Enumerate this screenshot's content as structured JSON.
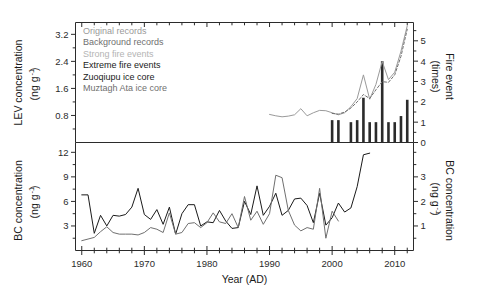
{
  "chart_data": {
    "type": "line",
    "title": "",
    "xlabel": "Year (AD)",
    "xlim": [
      1959,
      2013
    ],
    "xticks": [
      1960,
      1970,
      1980,
      1990,
      2000,
      2010
    ],
    "xticklabels": [
      "1960",
      "1970",
      "1980",
      "1990",
      "2000",
      "2010"
    ],
    "x_minor_step": 2,
    "grid": false,
    "legend_position": "top-left",
    "legend": [
      {
        "label": "Original records",
        "color": "#9a9a9a"
      },
      {
        "label": "Background records",
        "color": "#6f6f6f"
      },
      {
        "label": "Strong fire events",
        "color": "#b4b4b4"
      },
      {
        "label": "Extreme fire events",
        "color": "#1a1a1a"
      },
      {
        "label": "Zuoqiupu ice core",
        "color": "#1a1a1a"
      },
      {
        "label": "Muztagh Ata ice core",
        "color": "#6f6f6f"
      }
    ],
    "panels": [
      {
        "name": "lev-panel",
        "ylabel": "LEV concentration",
        "yunits": "(ng g",
        "yunits_sup": "-1",
        "yunits_tail": ")",
        "ylim": [
          0,
          3.55
        ],
        "yticks": [
          0.8,
          1.6,
          2.4,
          3.2
        ],
        "yticklabels": [
          "0.8",
          "1.6",
          "2.4",
          "3.2"
        ],
        "y2label": "Fire event",
        "y2units": "(times)",
        "y2lim": [
          0,
          5.9
        ],
        "y2ticks": [
          0,
          1,
          2,
          3,
          4,
          5
        ],
        "y2ticklabels": [
          "0",
          "1",
          "2",
          "3",
          "4",
          "5"
        ],
        "series": [
          {
            "name": "Original records",
            "color": "#9a9a9a",
            "style": "solid",
            "width": 1,
            "x": [
              1990,
              1991,
              1992,
              1993,
              1994,
              1995,
              1996,
              1997,
              1998,
              1999,
              2000,
              2001,
              2002,
              2003,
              2004,
              2005,
              2006,
              2007,
              2008,
              2009,
              2010,
              2011,
              2012
            ],
            "values": [
              0.83,
              0.79,
              0.76,
              0.78,
              0.82,
              1.0,
              0.79,
              0.88,
              0.95,
              0.94,
              0.88,
              0.82,
              0.88,
              1.06,
              1.3,
              2.0,
              1.28,
              1.72,
              2.4,
              1.86,
              2.08,
              2.7,
              3.45
            ]
          },
          {
            "name": "Background records",
            "color": "#6f6f6f",
            "style": "dashed",
            "width": 1,
            "x": [
              2000,
              2001,
              2002,
              2003,
              2004,
              2005,
              2006,
              2007,
              2008,
              2009,
              2010,
              2011,
              2012
            ],
            "values": [
              0.86,
              0.84,
              0.9,
              1.02,
              1.2,
              1.42,
              1.3,
              1.56,
              1.8,
              1.78,
              2.0,
              2.55,
              3.35
            ]
          }
        ],
        "bars": {
          "name": "Fire events",
          "color": "#2b2b2b",
          "x": [
            2000,
            2001,
            2003,
            2004,
            2005,
            2006,
            2007,
            2008,
            2009,
            2010,
            2011,
            2012
          ],
          "values": [
            1.1,
            1.1,
            1.0,
            1.1,
            2.2,
            1.0,
            1.0,
            4.0,
            1.0,
            1.0,
            1.3,
            2.1
          ]
        }
      },
      {
        "name": "bc-panel",
        "ylabel": "BC concentration",
        "yunits": "(ng g",
        "yunits_sup": "-1",
        "yunits_tail": ")",
        "ylim": [
          0,
          13.2
        ],
        "yticks": [
          3,
          6,
          9,
          12
        ],
        "yticklabels": [
          "3",
          "6",
          "9",
          "12"
        ],
        "y2label": "BC concentration",
        "y2units": "(ng g",
        "y2units_sup": "-1",
        "y2units_tail": ")",
        "y2lim": [
          0,
          4.4
        ],
        "y2ticks": [
          1,
          2,
          3
        ],
        "y2ticklabels": [
          "1",
          "2",
          "3"
        ],
        "series": [
          {
            "name": "Zuoqiupu ice core",
            "color": "#1a1a1a",
            "style": "solid",
            "width": 1,
            "x": [
              1960,
              1961,
              1962,
              1963,
              1964,
              1965,
              1966,
              1967,
              1968,
              1969,
              1970,
              1971,
              1972,
              1973,
              1974,
              1975,
              1976,
              1977,
              1978,
              1979,
              1980,
              1981,
              1982,
              1983,
              1984,
              1985,
              1986,
              1987,
              1988,
              1989,
              1990,
              1991,
              1992,
              1993,
              1994,
              1995,
              1996,
              1997,
              1998,
              1999,
              2000,
              2001,
              2002,
              2003,
              2004,
              2005,
              2006
            ],
            "values": [
              6.8,
              6.8,
              2.1,
              4.3,
              3.0,
              4.3,
              4.2,
              4.4,
              5.3,
              7.6,
              4.4,
              3.8,
              5.0,
              3.2,
              5.3,
              2.0,
              4.5,
              5.6,
              5.6,
              3.0,
              3.5,
              3.4,
              4.9,
              3.6,
              2.7,
              2.8,
              6.0,
              4.4,
              7.9,
              4.3,
              5.4,
              7.0,
              4.3,
              4.9,
              6.3,
              6.4,
              5.5,
              3.4,
              7.0,
              3.1,
              4.0,
              5.8,
              4.7,
              5.2,
              7.8,
              11.7,
              11.9
            ]
          },
          {
            "name": "Muztagh Ata ice core",
            "color": "#6f6f6f",
            "style": "solid",
            "width": 1,
            "x": [
              1960,
              1961,
              1962,
              1963,
              1964,
              1965,
              1966,
              1967,
              1968,
              1969,
              1970,
              1971,
              1972,
              1973,
              1974,
              1975,
              1976,
              1977,
              1978,
              1979,
              1980,
              1981,
              1982,
              1983,
              1984,
              1985,
              1986,
              1987,
              1988,
              1989,
              1990,
              1991,
              1992,
              1993,
              1994,
              1995,
              1996,
              1997,
              1998,
              1999,
              2000,
              2001
            ],
            "values": [
              1.2,
              1.4,
              1.6,
              2.3,
              2.9,
              2.2,
              2.0,
              2.0,
              2.0,
              1.9,
              2.2,
              2.8,
              2.6,
              2.2,
              4.6,
              2.0,
              2.2,
              3.3,
              3.4,
              2.8,
              3.4,
              4.6,
              3.5,
              3.3,
              4.5,
              2.8,
              6.6,
              3.7,
              4.8,
              3.2,
              4.5,
              9.2,
              8.9,
              4.9,
              3.1,
              2.4,
              2.8,
              2.6,
              7.6,
              1.5,
              4.8,
              3.6
            ]
          }
        ]
      }
    ]
  }
}
